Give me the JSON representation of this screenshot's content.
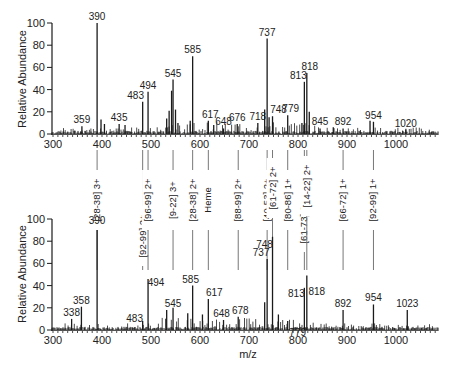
{
  "chart_data": [
    {
      "type": "bar",
      "subtype": "mass-spectrum",
      "title": "",
      "xlabel": "",
      "ylabel": "Relative Abundance",
      "xlim": [
        295,
        1085
      ],
      "ylim": [
        0,
        100
      ],
      "xticks": [
        300,
        400,
        500,
        600,
        700,
        800,
        900,
        1000
      ],
      "yticks": [
        0,
        20,
        40,
        60,
        80,
        100
      ],
      "grid": false,
      "peaks": [
        {
          "mz": 359,
          "intensity": 7,
          "label": "359"
        },
        {
          "mz": 390,
          "intensity": 100,
          "label": "390"
        },
        {
          "mz": 398,
          "intensity": 13,
          "label": ""
        },
        {
          "mz": 405,
          "intensity": 9,
          "label": ""
        },
        {
          "mz": 435,
          "intensity": 9,
          "label": "435"
        },
        {
          "mz": 447,
          "intensity": 8,
          "label": ""
        },
        {
          "mz": 483,
          "intensity": 29,
          "label": "483"
        },
        {
          "mz": 494,
          "intensity": 38,
          "label": "494"
        },
        {
          "mz": 532,
          "intensity": 14,
          "label": ""
        },
        {
          "mz": 537,
          "intensity": 21,
          "label": ""
        },
        {
          "mz": 542,
          "intensity": 39,
          "label": ""
        },
        {
          "mz": 545,
          "intensity": 49,
          "label": "545"
        },
        {
          "mz": 550,
          "intensity": 22,
          "label": ""
        },
        {
          "mz": 555,
          "intensity": 10,
          "label": ""
        },
        {
          "mz": 580,
          "intensity": 12,
          "label": ""
        },
        {
          "mz": 585,
          "intensity": 70,
          "label": "585"
        },
        {
          "mz": 617,
          "intensity": 12,
          "label": "617"
        },
        {
          "mz": 628,
          "intensity": 8,
          "label": ""
        },
        {
          "mz": 648,
          "intensity": 5,
          "label": "648"
        },
        {
          "mz": 676,
          "intensity": 9,
          "label": "676"
        },
        {
          "mz": 718,
          "intensity": 10,
          "label": "718"
        },
        {
          "mz": 732,
          "intensity": 22,
          "label": ""
        },
        {
          "mz": 737,
          "intensity": 86,
          "label": "737"
        },
        {
          "mz": 741,
          "intensity": 15,
          "label": ""
        },
        {
          "mz": 748,
          "intensity": 16,
          "label": "748"
        },
        {
          "mz": 779,
          "intensity": 17,
          "label": "779"
        },
        {
          "mz": 808,
          "intensity": 10,
          "label": ""
        },
        {
          "mz": 813,
          "intensity": 47,
          "label": "813"
        },
        {
          "mz": 818,
          "intensity": 55,
          "label": "818"
        },
        {
          "mz": 823,
          "intensity": 20,
          "label": ""
        },
        {
          "mz": 845,
          "intensity": 5,
          "label": "845"
        },
        {
          "mz": 872,
          "intensity": 6,
          "label": ""
        },
        {
          "mz": 892,
          "intensity": 5,
          "label": "892"
        },
        {
          "mz": 947,
          "intensity": 12,
          "label": ""
        },
        {
          "mz": 954,
          "intensity": 11,
          "label": "954"
        },
        {
          "mz": 1020,
          "intensity": 4,
          "label": "1020"
        }
      ]
    },
    {
      "type": "bar",
      "subtype": "mass-spectrum",
      "title": "",
      "xlabel": "m/z",
      "ylabel": "Relative Abundance",
      "xlim": [
        295,
        1085
      ],
      "ylim": [
        0,
        100
      ],
      "xticks": [
        300,
        400,
        500,
        600,
        700,
        800,
        900,
        1000
      ],
      "yticks": [
        0,
        20,
        40,
        60,
        80,
        100
      ],
      "grid": false,
      "peaks": [
        {
          "mz": 338,
          "intensity": 10,
          "label": "338"
        },
        {
          "mz": 358,
          "intensity": 21,
          "label": "358"
        },
        {
          "mz": 390,
          "intensity": 90,
          "label": "390"
        },
        {
          "mz": 483,
          "intensity": 8,
          "label": "483"
        },
        {
          "mz": 494,
          "intensity": 46,
          "label": "494"
        },
        {
          "mz": 532,
          "intensity": 18,
          "label": ""
        },
        {
          "mz": 545,
          "intensity": 20,
          "label": "545"
        },
        {
          "mz": 575,
          "intensity": 15,
          "label": ""
        },
        {
          "mz": 585,
          "intensity": 40,
          "label": "585"
        },
        {
          "mz": 605,
          "intensity": 14,
          "label": ""
        },
        {
          "mz": 617,
          "intensity": 28,
          "label": "617"
        },
        {
          "mz": 648,
          "intensity": 9,
          "label": "648"
        },
        {
          "mz": 678,
          "intensity": 12,
          "label": "678"
        },
        {
          "mz": 732,
          "intensity": 25,
          "label": ""
        },
        {
          "mz": 737,
          "intensity": 64,
          "label": "737"
        },
        {
          "mz": 748,
          "intensity": 84,
          "label": "748"
        },
        {
          "mz": 760,
          "intensity": 14,
          "label": ""
        },
        {
          "mz": 779,
          "intensity": 8,
          "label": "779"
        },
        {
          "mz": 813,
          "intensity": 38,
          "label": "813"
        },
        {
          "mz": 818,
          "intensity": 49,
          "label": "818"
        },
        {
          "mz": 892,
          "intensity": 18,
          "label": "892"
        },
        {
          "mz": 954,
          "intensity": 23,
          "label": "954"
        },
        {
          "mz": 1023,
          "intensity": 18,
          "label": "1023"
        }
      ]
    }
  ],
  "annotations": [
    {
      "mz": 390,
      "label": "[28-38] 3+"
    },
    {
      "mz": 483,
      "label": "[92-99] 2+"
    },
    {
      "mz": 494,
      "label": "[96-99] 2+"
    },
    {
      "mz": 545,
      "label": "[9-22] 3+"
    },
    {
      "mz": 585,
      "label": "[28-38] 2+"
    },
    {
      "mz": 617,
      "label": "Heme"
    },
    {
      "mz": 678,
      "label": "[88-99] 2+"
    },
    {
      "mz": 737,
      "label": "[40-53] 2+"
    },
    {
      "mz": 748,
      "label": "[61-72] 2+"
    },
    {
      "mz": 779,
      "label": "[80-86] 1+"
    },
    {
      "mz": 813,
      "label": "[61-73] 2+"
    },
    {
      "mz": 818,
      "label": "[14-22] 2+"
    },
    {
      "mz": 892,
      "label": "[66-72] 1+"
    },
    {
      "mz": 954,
      "label": "[92-99] 1+"
    }
  ],
  "labels": {
    "top_ylabel": "Relative Abundance",
    "bottom_ylabel": "Relative Abundance",
    "bottom_xlabel": "m/z"
  },
  "colors": {
    "ink": "#1a1a1a",
    "connector": "#777777"
  }
}
